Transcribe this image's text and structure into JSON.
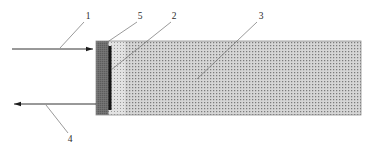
{
  "figure": {
    "type": "technical-cross-section-diagram",
    "background_color": "#ffffff",
    "canvas": {
      "width": 377,
      "height": 150
    },
    "labels": [
      {
        "id": "1",
        "text": "1",
        "x": 88,
        "y": 16,
        "role": "incoming-beam-callout"
      },
      {
        "id": "5",
        "text": "5",
        "x": 140,
        "y": 16,
        "role": "outer-layer-callout"
      },
      {
        "id": "2",
        "text": "2",
        "x": 174,
        "y": 16,
        "role": "inner-bar-callout"
      },
      {
        "id": "3",
        "text": "3",
        "x": 261,
        "y": 16,
        "role": "body-medium-callout"
      },
      {
        "id": "4",
        "text": "4",
        "x": 70,
        "y": 140,
        "role": "outgoing-beam-callout"
      }
    ],
    "leader_lines": [
      {
        "for": "1",
        "x1": 84,
        "y1": 22,
        "x2": 60,
        "y2": 49
      },
      {
        "for": "5",
        "x1": 137,
        "y1": 22,
        "x2": 106,
        "y2": 43
      },
      {
        "for": "2",
        "x1": 171,
        "y1": 22,
        "x2": 111,
        "y2": 70
      },
      {
        "for": "3",
        "x1": 257,
        "y1": 22,
        "x2": 198,
        "y2": 78
      },
      {
        "for": "4",
        "x1": 68,
        "y1": 134,
        "x2": 45,
        "y2": 104
      }
    ],
    "arrows": [
      {
        "name": "incoming-beam-arrow",
        "direction": "right",
        "x1": 12,
        "y1": 49,
        "x2": 95,
        "y2": 49,
        "color": "#1c1c1c"
      },
      {
        "name": "outgoing-beam-arrow",
        "direction": "left",
        "x1": 96,
        "y1": 104,
        "x2": 12,
        "y2": 104,
        "color": "#1c1c1c"
      }
    ],
    "regions": [
      {
        "name": "outer-dark-layer",
        "ref": "5",
        "x": 96,
        "y": 41,
        "width": 12,
        "height": 74,
        "fill": "#6e6e6e",
        "pattern": "fine-vertical-texture"
      },
      {
        "name": "inner-black-bar",
        "ref": "2",
        "x": 108.5,
        "y": 46,
        "width": 3,
        "height": 64,
        "fill": "#151515",
        "pattern": "solid"
      },
      {
        "name": "transition-light-layer",
        "x": 108,
        "y": 41,
        "width": 17,
        "height": 74,
        "fill": "#d8d8d8",
        "pattern": "light-stipple"
      },
      {
        "name": "main-body-medium",
        "ref": "3",
        "x": 125,
        "y": 41,
        "width": 236,
        "height": 74,
        "fill": "#cfcfcf",
        "pattern": "dense-dot-stipple"
      }
    ],
    "outline": {
      "name": "body-outline",
      "x": 96,
      "y": 41,
      "width": 265,
      "height": 74,
      "stroke": "#8a8a8a",
      "stroke_width": 0.8
    }
  }
}
